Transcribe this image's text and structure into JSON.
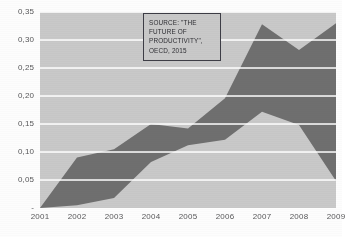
{
  "chart_data": {
    "type": "area",
    "stacked": true,
    "title": "",
    "xlabel": "",
    "ylabel": "",
    "categories": [
      "2001",
      "2002",
      "2003",
      "2004",
      "2005",
      "2006",
      "2007",
      "2008",
      "2009"
    ],
    "x_tick_labels": [
      "2001",
      "2002",
      "2003",
      "2004",
      "2005",
      "2006",
      "2007",
      "2008",
      "2009"
    ],
    "y_tick_labels": [
      "0,35",
      "0,30",
      "0,25",
      "0,20",
      "0,15",
      "0,10",
      "0,05",
      "-"
    ],
    "y_tick_values": [
      0.35,
      0.3,
      0.25,
      0.2,
      0.15,
      0.1,
      0.05,
      0.0
    ],
    "ylim": [
      0.0,
      0.35
    ],
    "grid": true,
    "grid_color": "#ffffff",
    "legend": "none",
    "series": [
      {
        "name": "lower-band",
        "color": "#c9c9c9",
        "values": [
          0.0,
          0.005,
          0.018,
          0.082,
          0.112,
          0.122,
          0.172,
          0.148,
          0.048
        ]
      },
      {
        "name": "upper-band",
        "color": "#6f6f6f",
        "values": [
          0.0,
          0.09,
          0.105,
          0.15,
          0.142,
          0.196,
          0.328,
          0.282,
          0.33
        ]
      }
    ],
    "annotations": [
      {
        "name": "source-note",
        "lines": [
          "SOURCE: \"THE",
          "FUTURE OF",
          "PRODUCTIVITY\",",
          "OECD, 2015"
        ]
      }
    ],
    "colors": {
      "plot_background": "#c9c9c9",
      "dark_series": "#6f6f6f",
      "light_series": "#c9c9c9",
      "gridline": "#ffffff",
      "tick_label": "#58585a",
      "annotation_border": "#3d3d46",
      "page_background": "#fdfdfd"
    }
  }
}
